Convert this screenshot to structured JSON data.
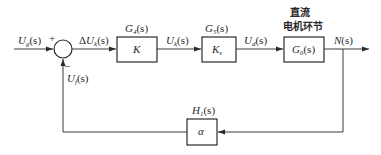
{
  "diagram": {
    "type": "block-diagram",
    "title_cn": "直流电机环节",
    "signals": {
      "input": {
        "main": "U",
        "sub": "g",
        "arg": "(s)"
      },
      "error": {
        "main": "ΔU",
        "sub": "k",
        "arg": "(s)"
      },
      "after_k": {
        "main": "U",
        "sub": "k",
        "arg": "(s)"
      },
      "after_ks": {
        "main": "U",
        "sub": "d",
        "arg": "(s)"
      },
      "output": {
        "main": "N",
        "sub": "",
        "arg": "(s)"
      },
      "feedback": {
        "main": "U",
        "sub": "f",
        "arg": "(s)"
      }
    },
    "summing_junction": {
      "plus": "+",
      "minus": "−"
    },
    "blocks": [
      {
        "id": "g4",
        "tf_main": "G",
        "tf_sub": "4",
        "tf_arg": "(s)",
        "content_main": "K",
        "content_sub": ""
      },
      {
        "id": "g5",
        "tf_main": "G",
        "tf_sub": "5",
        "tf_arg": "(s)",
        "content_main": "K",
        "content_sub": "s"
      },
      {
        "id": "g6",
        "tf_main": "G",
        "tf_sub": "6",
        "tf_arg": "(s)",
        "content_main": "G",
        "content_sub": "6",
        "content_arg": "(s)",
        "header_line1": "直流",
        "header_line2": "电机环节"
      },
      {
        "id": "h1",
        "tf_main": "H",
        "tf_sub": "1",
        "tf_arg": "(s)",
        "content_main": "α",
        "content_sub": ""
      }
    ]
  }
}
